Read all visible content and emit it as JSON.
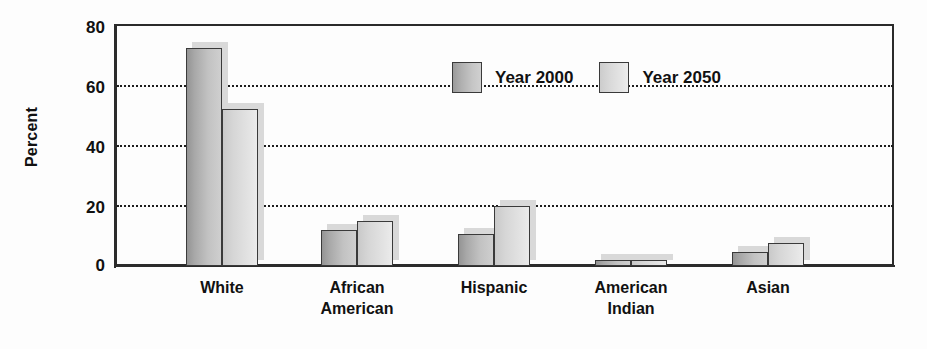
{
  "chart_data": {
    "type": "bar",
    "title": "",
    "xlabel": "",
    "ylabel": "Percent",
    "ylim": [
      0,
      80
    ],
    "yticks": [
      0,
      20,
      40,
      60,
      80
    ],
    "grid": "horizontal-dotted",
    "legend_position": "inside-top-center",
    "categories": [
      "White",
      "African American",
      "Hispanic",
      "American Indian",
      "Asian"
    ],
    "series": [
      {
        "name": "Year 2000",
        "values": [
          72,
          12,
          10.5,
          2,
          4.5
        ]
      },
      {
        "name": "Year 2050",
        "values": [
          52,
          15,
          20,
          2,
          7.5
        ]
      }
    ]
  },
  "axis": {
    "y_title": "Percent",
    "ticks": [
      {
        "label": "80"
      },
      {
        "label": "60"
      },
      {
        "label": "40"
      },
      {
        "label": "20"
      },
      {
        "label": "0"
      }
    ]
  },
  "legend": {
    "entries": [
      {
        "label": "Year 2000",
        "swatch": "legend-swatch-year-2000"
      },
      {
        "label": "Year 2050",
        "swatch": "legend-swatch-year-2050"
      }
    ]
  },
  "x_categories": [
    {
      "line1": "White",
      "line2": ""
    },
    {
      "line1": "African",
      "line2": "American"
    },
    {
      "line1": "Hispanic",
      "line2": ""
    },
    {
      "line1": "American",
      "line2": "Indian"
    },
    {
      "line1": "Asian",
      "line2": ""
    }
  ],
  "colors": {
    "axis": "#2b2b2b",
    "gridline": "#1d1d1d",
    "text": "#111111",
    "series_2000_dark": "#949494",
    "series_2000_light": "#cfcfcf",
    "series_2050_dark": "#c9c9c9",
    "series_2050_light": "#ebebeb",
    "bar_border": "#3a3a3a",
    "bar_shadow": "#d9d9d9",
    "background": "#fdfdfd"
  }
}
